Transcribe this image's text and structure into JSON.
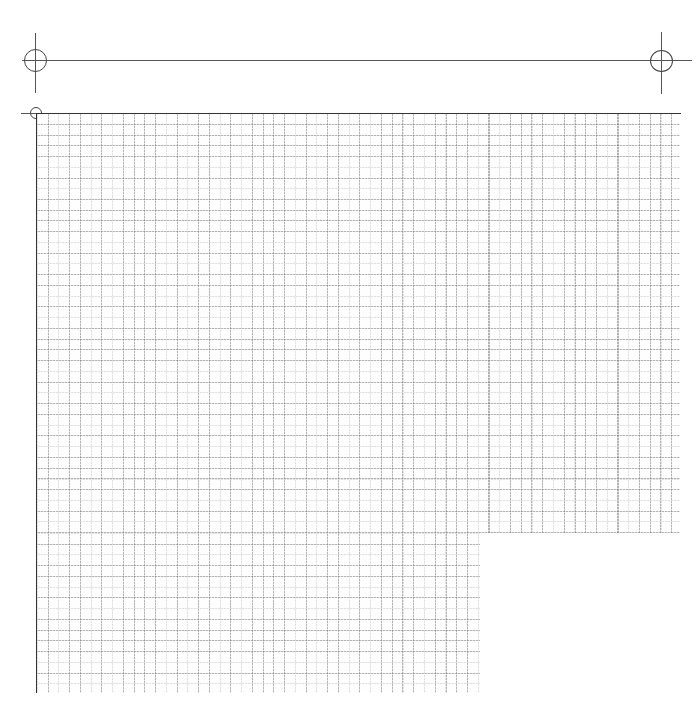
{
  "sheet": {
    "type": "graph-paper",
    "grid_cell_px": 10.75,
    "line_color": "#888888",
    "registration_marks": [
      "top-left-large",
      "top-right-large",
      "grid-origin-small"
    ]
  }
}
